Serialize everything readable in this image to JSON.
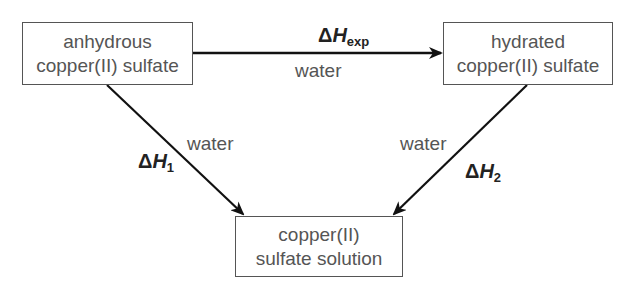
{
  "diagram": {
    "type": "enthalpy-cycle",
    "nodes": {
      "anhydrous": {
        "line1": "anhydrous",
        "line2": "copper(II) sulfate"
      },
      "hydrated": {
        "line1": "hydrated",
        "line2": "copper(II) sulfate"
      },
      "solution": {
        "line1": "copper(II)",
        "line2": "sulfate solution"
      }
    },
    "edges": {
      "top": {
        "from": "anhydrous copper(II) sulfate",
        "to": "hydrated copper(II) sulfate",
        "enthalpy_symbol": "Δ",
        "enthalpy_var": "H",
        "enthalpy_sub": "exp",
        "reagent": "water"
      },
      "left": {
        "from": "anhydrous copper(II) sulfate",
        "to": "copper(II) sulfate solution",
        "enthalpy_symbol": "Δ",
        "enthalpy_var": "H",
        "enthalpy_sub": "1",
        "reagent": "water"
      },
      "right": {
        "from": "hydrated copper(II) sulfate",
        "to": "copper(II) sulfate solution",
        "enthalpy_symbol": "Δ",
        "enthalpy_var": "H",
        "enthalpy_sub": "2",
        "reagent": "water"
      }
    }
  },
  "colors": {
    "box_border": "#555555",
    "box_text": "#555555",
    "arrow": "#111111",
    "enthalpy_label": "#222222",
    "background": "#ffffff"
  }
}
